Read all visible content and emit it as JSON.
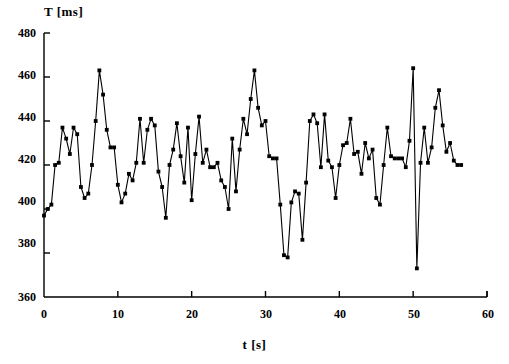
{
  "chart_data": {
    "type": "line",
    "title": "",
    "subtitle": "",
    "xlabel": "t [s]",
    "ylabel": "T [ms]",
    "xlim": [
      0,
      60
    ],
    "ylim": [
      360,
      480
    ],
    "xticks": [
      0,
      10,
      20,
      30,
      40,
      50,
      60
    ],
    "yticks": [
      360,
      380,
      400,
      420,
      440,
      460,
      480
    ],
    "grid": false,
    "legend": null,
    "marker": "filled-square",
    "line_color": "#000000",
    "marker_color": "#000000",
    "annotations": [],
    "series": [
      {
        "name": "T",
        "x": [
          0.0,
          0.5,
          1.0,
          1.5,
          2.0,
          2.5,
          3.0,
          3.5,
          4.0,
          4.5,
          5.0,
          5.5,
          6.0,
          6.5,
          7.0,
          7.5,
          8.0,
          8.5,
          9.0,
          9.5,
          10.0,
          10.5,
          11.0,
          11.5,
          12.0,
          12.5,
          13.0,
          13.5,
          14.0,
          14.5,
          15.0,
          15.5,
          16.0,
          16.5,
          17.0,
          17.5,
          18.0,
          18.5,
          19.0,
          19.5,
          20.0,
          20.5,
          21.0,
          21.5,
          22.0,
          22.5,
          23.0,
          23.5,
          24.0,
          24.5,
          25.0,
          25.5,
          26.0,
          26.5,
          27.0,
          27.5,
          28.0,
          28.5,
          29.0,
          29.5,
          30.0,
          30.5,
          31.0,
          31.5,
          32.0,
          32.5,
          33.0,
          33.5,
          34.0,
          34.5,
          35.0,
          35.5,
          36.0,
          36.5,
          37.0,
          37.5,
          38.0,
          38.5,
          39.0,
          39.5,
          40.0,
          40.5,
          41.0,
          41.5,
          42.0,
          42.5,
          43.0,
          43.5,
          44.0,
          44.5,
          45.0,
          45.5,
          46.0,
          46.5,
          47.0,
          47.5,
          48.0,
          48.5,
          49.0,
          49.5,
          50.0,
          50.5,
          51.0,
          51.5,
          52.0,
          52.5,
          53.0,
          53.5,
          54.0,
          54.5,
          55.0,
          55.5,
          56.0,
          56.5
        ],
        "y": [
          397,
          400,
          402,
          420,
          421,
          437,
          432,
          425,
          437,
          434,
          410,
          405,
          407,
          420,
          440,
          463,
          452,
          436,
          428,
          428,
          411,
          403,
          407,
          416,
          413,
          421,
          441,
          421,
          436,
          441,
          438,
          417,
          410,
          396,
          420,
          427,
          439,
          424,
          412,
          437,
          404,
          425,
          442,
          421,
          427,
          419,
          419,
          421,
          413,
          410,
          400,
          432,
          408,
          427,
          441,
          434,
          450,
          463,
          446,
          438,
          440,
          424,
          423,
          423,
          402,
          379,
          378,
          403,
          408,
          407,
          386,
          412,
          440,
          443,
          439,
          419,
          443,
          422,
          419,
          405,
          420,
          429,
          430,
          441,
          425,
          426,
          416,
          430,
          423,
          427,
          405,
          402,
          420,
          437,
          424,
          423,
          423,
          423,
          419,
          431,
          464,
          373,
          421,
          437,
          421,
          428,
          446,
          454,
          438,
          426,
          430,
          422,
          420,
          420
        ]
      }
    ]
  },
  "axes": {
    "y_title": "T [ms]",
    "x_title": "t [s]",
    "y_tick_labels": [
      "480",
      "460",
      "440",
      "420",
      "400",
      "380",
      "360"
    ],
    "x_tick_labels": [
      "0",
      "10",
      "20",
      "30",
      "40",
      "50",
      "60"
    ]
  }
}
